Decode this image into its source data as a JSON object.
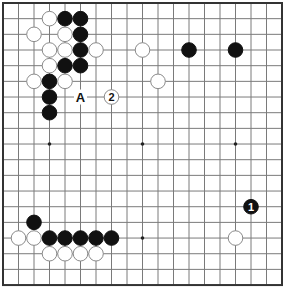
{
  "board": {
    "size": 19,
    "origin_x": 3,
    "origin_y": 3,
    "spacing_x": 15.5,
    "spacing_y": 15.67,
    "stone_radius": 7.3,
    "colors": {
      "black": "#111111",
      "white": "#ffffff",
      "grid": "#7a7a7a",
      "border": "#333333"
    },
    "hoshi": [
      {
        "col": 3,
        "row": 9
      },
      {
        "col": 9,
        "row": 9
      },
      {
        "col": 15,
        "row": 9
      },
      {
        "col": 9,
        "row": 15
      }
    ],
    "stones": [
      {
        "color": "white",
        "col": 3,
        "row": 1
      },
      {
        "color": "black",
        "col": 4,
        "row": 1
      },
      {
        "color": "black",
        "col": 5,
        "row": 1
      },
      {
        "color": "white",
        "col": 2,
        "row": 2
      },
      {
        "color": "white",
        "col": 4,
        "row": 2
      },
      {
        "color": "black",
        "col": 5,
        "row": 2
      },
      {
        "color": "white",
        "col": 3,
        "row": 3
      },
      {
        "color": "white",
        "col": 4,
        "row": 3
      },
      {
        "color": "black",
        "col": 5,
        "row": 3
      },
      {
        "color": "white",
        "col": 6,
        "row": 3
      },
      {
        "color": "white",
        "col": 9,
        "row": 3
      },
      {
        "color": "black",
        "col": 12,
        "row": 3
      },
      {
        "color": "black",
        "col": 15,
        "row": 3
      },
      {
        "color": "white",
        "col": 3,
        "row": 4
      },
      {
        "color": "black",
        "col": 4,
        "row": 4
      },
      {
        "color": "black",
        "col": 5,
        "row": 4
      },
      {
        "color": "white",
        "col": 2,
        "row": 5
      },
      {
        "color": "black",
        "col": 3,
        "row": 5
      },
      {
        "color": "white",
        "col": 4,
        "row": 5
      },
      {
        "color": "white",
        "col": 10,
        "row": 5
      },
      {
        "color": "black",
        "col": 3,
        "row": 6
      },
      {
        "color": "white",
        "col": 7,
        "row": 6,
        "number": "2"
      },
      {
        "color": "black",
        "col": 3,
        "row": 7
      },
      {
        "color": "black",
        "col": 16,
        "row": 13,
        "number": "1"
      },
      {
        "color": "black",
        "col": 2,
        "row": 14
      },
      {
        "color": "white",
        "col": 1,
        "row": 15
      },
      {
        "color": "white",
        "col": 2,
        "row": 15
      },
      {
        "color": "black",
        "col": 3,
        "row": 15
      },
      {
        "color": "black",
        "col": 4,
        "row": 15
      },
      {
        "color": "black",
        "col": 5,
        "row": 15
      },
      {
        "color": "black",
        "col": 6,
        "row": 15
      },
      {
        "color": "black",
        "col": 7,
        "row": 15
      },
      {
        "color": "white",
        "col": 15,
        "row": 15
      },
      {
        "color": "white",
        "col": 3,
        "row": 16
      },
      {
        "color": "white",
        "col": 4,
        "row": 16
      },
      {
        "color": "white",
        "col": 5,
        "row": 16
      },
      {
        "color": "white",
        "col": 6,
        "row": 16
      }
    ],
    "labels": [
      {
        "text": "A",
        "col": 5,
        "row": 6
      }
    ]
  }
}
